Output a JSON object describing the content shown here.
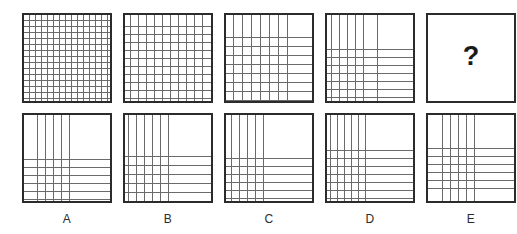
{
  "puzzle": {
    "type": "matrix-reasoning-visual-iq-test",
    "title": "",
    "missing_marker": "?",
    "colors": {
      "background": "#ffffff",
      "panel_border": "#2b2b2b",
      "grid_line": "#6a6a6a",
      "marker_text": "#1a1a1a",
      "label_text": "#2b2b2b"
    },
    "layout": {
      "panel_size": 90,
      "row1_top": 13,
      "row2_top": 113,
      "panel_x": [
        22,
        123,
        224,
        325,
        426
      ],
      "label_y": 212
    }
  },
  "sequence": {
    "name": "question-row",
    "description": "Top row of four grid patterns followed by a missing fifth cell",
    "panels": [
      {
        "id": "seq-1",
        "position": 1,
        "vertical_lines": [
          5,
          11,
          17,
          23,
          29,
          35,
          41,
          47,
          53,
          59,
          65,
          71,
          77,
          83
        ],
        "horizontal_lines": [
          5,
          11,
          17,
          23,
          29,
          35,
          41,
          47,
          53,
          59,
          65,
          71,
          77,
          83
        ],
        "vertical_count": 14,
        "horizontal_count": 14
      },
      {
        "id": "seq-2",
        "position": 2,
        "vertical_lines": [
          5,
          13,
          21,
          29,
          37,
          45,
          53,
          61,
          69,
          77
        ],
        "horizontal_lines": [
          11,
          19,
          27,
          35,
          43,
          51,
          59,
          67,
          75,
          83
        ],
        "vertical_count": 10,
        "horizontal_count": 10
      },
      {
        "id": "seq-3",
        "position": 3,
        "vertical_lines": [
          7,
          16,
          25,
          34,
          43,
          52,
          61
        ],
        "horizontal_lines": [
          22,
          31,
          40,
          49,
          58,
          67,
          76,
          85
        ],
        "vertical_count": 7,
        "horizontal_count": 8
      },
      {
        "id": "seq-4",
        "position": 4,
        "vertical_lines": [
          4,
          12,
          20,
          28,
          36,
          50
        ],
        "horizontal_lines": [
          34,
          42,
          50,
          58,
          66,
          74,
          82
        ],
        "vertical_count": 6,
        "horizontal_count": 7
      },
      {
        "id": "seq-5",
        "position": 5,
        "is_missing": true,
        "marker": "?",
        "vertical_lines": [],
        "horizontal_lines": []
      }
    ]
  },
  "options": {
    "name": "answer-options-row",
    "items": [
      {
        "id": "option-a",
        "label": "A",
        "vertical_lines": [
          13,
          21,
          29,
          37,
          45
        ],
        "horizontal_lines": [
          44,
          52,
          60,
          68,
          76,
          84
        ],
        "vertical_count": 5,
        "horizontal_count": 6
      },
      {
        "id": "option-b",
        "label": "B",
        "vertical_lines": [
          3,
          11,
          19,
          27,
          35,
          43
        ],
        "horizontal_lines": [
          41,
          50,
          59,
          68,
          77,
          86
        ],
        "vertical_count": 6,
        "horizontal_count": 6
      },
      {
        "id": "option-c",
        "label": "C",
        "vertical_lines": [
          5,
          13,
          21,
          29,
          37
        ],
        "horizontal_lines": [
          43,
          51,
          59,
          67,
          75,
          83
        ],
        "vertical_count": 5,
        "horizontal_count": 6
      },
      {
        "id": "option-d",
        "label": "D",
        "vertical_lines": [
          3,
          10,
          17,
          24,
          31,
          38
        ],
        "horizontal_lines": [
          35,
          43,
          51,
          59,
          67,
          75,
          83
        ],
        "vertical_count": 6,
        "horizontal_count": 7
      },
      {
        "id": "option-e",
        "label": "E",
        "vertical_lines": [
          14,
          22,
          30,
          38,
          46
        ],
        "horizontal_lines": [
          33,
          41,
          49,
          57,
          65,
          73
        ],
        "vertical_count": 5,
        "horizontal_count": 6
      }
    ]
  }
}
